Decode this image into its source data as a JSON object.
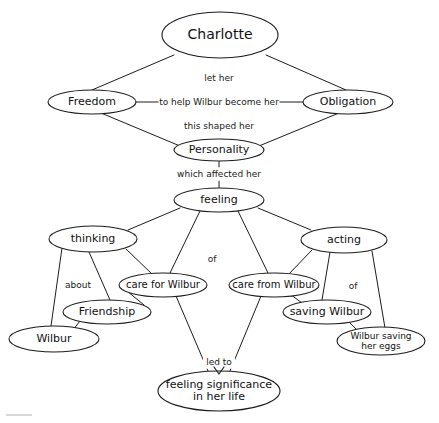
{
  "diagram": {
    "type": "concept-map",
    "background_color": "#ffffff",
    "stroke_color": "#1c1c1c",
    "text_color": "#111111",
    "nodes": [
      {
        "id": "charlotte",
        "label": "Charlotte",
        "cx": 220,
        "cy": 35,
        "rx": 58,
        "ry": 23,
        "font_size": 14
      },
      {
        "id": "freedom",
        "label": "Freedom",
        "cx": 92,
        "cy": 102,
        "rx": 44,
        "ry": 12,
        "font_size": 11
      },
      {
        "id": "obligation",
        "label": "Obligation",
        "cx": 348,
        "cy": 102,
        "rx": 45,
        "ry": 12,
        "font_size": 11
      },
      {
        "id": "personality",
        "label": "Personality",
        "cx": 219,
        "cy": 150,
        "rx": 45,
        "ry": 11,
        "font_size": 11
      },
      {
        "id": "feeling",
        "label": "feeling",
        "cx": 219,
        "cy": 200,
        "rx": 45,
        "ry": 12,
        "font_size": 11
      },
      {
        "id": "thinking",
        "label": "thinking",
        "cx": 93,
        "cy": 239,
        "rx": 44,
        "ry": 13,
        "font_size": 11
      },
      {
        "id": "acting",
        "label": "acting",
        "cx": 344,
        "cy": 240,
        "rx": 43,
        "ry": 13,
        "font_size": 11
      },
      {
        "id": "careforw",
        "label": "care for Wilbur",
        "cx": 163,
        "cy": 285,
        "rx": 44,
        "ry": 12,
        "font_size": 10
      },
      {
        "id": "carefromw",
        "label": "care from Wilbur",
        "cx": 274,
        "cy": 285,
        "rx": 45,
        "ry": 12,
        "font_size": 10
      },
      {
        "id": "friendship",
        "label": "Friendship",
        "cx": 107,
        "cy": 312,
        "rx": 44,
        "ry": 12,
        "font_size": 11
      },
      {
        "id": "savingw",
        "label": "saving Wilbur",
        "cx": 327,
        "cy": 312,
        "rx": 44,
        "ry": 12,
        "font_size": 11
      },
      {
        "id": "wilbur",
        "label": "Wilbur",
        "cx": 54,
        "cy": 339,
        "rx": 45,
        "ry": 13,
        "font_size": 11
      },
      {
        "id": "wsavingeggs",
        "label": "Wilbur saving\nher eggs",
        "cx": 381,
        "cy": 341,
        "rx": 44,
        "ry": 14,
        "font_size": 9
      },
      {
        "id": "feelsig",
        "label": "feeling significance\nin her life",
        "cx": 219,
        "cy": 391,
        "rx": 61,
        "ry": 20,
        "font_size": 11
      }
    ],
    "edges": [
      {
        "from": "charlotte",
        "to": "freedom",
        "label": "",
        "points": "174,55 92,90"
      },
      {
        "from": "charlotte",
        "to": "obligation",
        "label": "",
        "points": "266,55 346,90"
      },
      {
        "from": "freedom",
        "to": "obligation",
        "label": "to help Wilbur become her",
        "points": "136,102 303,102"
      },
      {
        "from": "freedom",
        "to": "personality",
        "label": "",
        "points": "101,113 180,146"
      },
      {
        "from": "obligation",
        "to": "personality",
        "label": "",
        "points": "339,113 259,146"
      },
      {
        "from": "personality",
        "to": "feeling",
        "label": "which affected her",
        "points": "219,161 219,188"
      },
      {
        "from": "feeling",
        "to": "thinking",
        "label": "",
        "points": "180,208 128,230"
      },
      {
        "from": "feeling",
        "to": "careforw",
        "label": "",
        "points": "200,211 170,273"
      },
      {
        "from": "feeling",
        "to": "carefromw",
        "label": "",
        "points": "238,211 268,273"
      },
      {
        "from": "feeling",
        "to": "acting",
        "label": "",
        "points": "258,208 311,230"
      },
      {
        "from": "thinking",
        "to": "wilbur",
        "label": "about",
        "points": "62,248 51,326"
      },
      {
        "from": "thinking",
        "to": "friendship",
        "label": "",
        "points": "89,252 110,300"
      },
      {
        "from": "thinking",
        "to": "careforw",
        "label": "",
        "points": "126,249 152,274"
      },
      {
        "from": "friendship",
        "to": "wilbur",
        "label": "",
        "points": "80,321 73,330"
      },
      {
        "from": "careforw",
        "to": "friendship",
        "label": "",
        "points": "127,291 144,305"
      },
      {
        "from": "careforw",
        "to": "feelsig",
        "label": "led to",
        "points": "176,296 208,371"
      },
      {
        "from": "carefromw",
        "to": "feelsig",
        "label": "",
        "points": "261,296 230,371"
      },
      {
        "from": "acting",
        "to": "carefromw",
        "label": "",
        "points": "312,250 289,274"
      },
      {
        "from": "acting",
        "to": "savingw",
        "label": "of",
        "points": "330,252 322,300"
      },
      {
        "from": "acting",
        "to": "wsavingeggs",
        "label": "",
        "points": "372,251 385,328"
      },
      {
        "from": "carefromw",
        "to": "savingw",
        "label": "",
        "points": "290,294 302,303"
      },
      {
        "from": "savingw",
        "to": "wsavingeggs",
        "label": "",
        "points": "348,321 358,331"
      }
    ],
    "edge_labels": [
      {
        "id": "let-her",
        "text": "let her",
        "x": 219,
        "y": 78,
        "font_size": 9
      },
      {
        "id": "to-help",
        "text": "to help Wilbur become her",
        "x": 219,
        "y": 102,
        "font_size": 9
      },
      {
        "id": "this-shaped",
        "text": "this shaped her",
        "x": 219,
        "y": 126,
        "font_size": 9
      },
      {
        "id": "which-affected",
        "text": "which affected her",
        "x": 219,
        "y": 174,
        "font_size": 9
      },
      {
        "id": "of-left",
        "text": "of",
        "x": 212,
        "y": 259,
        "font_size": 9
      },
      {
        "id": "about",
        "text": "about",
        "x": 78,
        "y": 285,
        "font_size": 9
      },
      {
        "id": "of-right",
        "text": "of",
        "x": 353,
        "y": 286,
        "font_size": 9
      },
      {
        "id": "led-to",
        "text": "led to",
        "x": 219,
        "y": 362,
        "font_size": 9
      }
    ],
    "arrowheads": [
      {
        "id": "led-to-arrow",
        "x": 219,
        "y": 371,
        "points": "214,367 219,374 224,367"
      }
    ]
  }
}
